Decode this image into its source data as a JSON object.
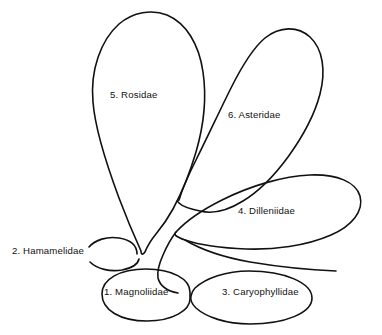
{
  "diagram": {
    "type": "bubble-relationship-diagram",
    "background_color": "#ffffff",
    "stroke_color": "#111111",
    "width": 382,
    "height": 335,
    "lobes": [
      {
        "id": "magnoliidae",
        "number": "1.",
        "name": "Magnoliidae",
        "label": "1. Magnoliidae",
        "label_x": 104,
        "label_y": 287
      },
      {
        "id": "hamamelidae",
        "number": "2.",
        "name": "Hamamelidae",
        "label": "2. Hamamelidae",
        "label_x": 12,
        "label_y": 246
      },
      {
        "id": "caryophyllidae",
        "number": "3.",
        "name": "Caryophyllidae",
        "label": "3. Caryophyllidae",
        "label_x": 222,
        "label_y": 287
      },
      {
        "id": "dilleniidae",
        "number": "4.",
        "name": "Dilleniidae",
        "label": "4. Dilleniidae",
        "label_x": 238,
        "label_y": 206
      },
      {
        "id": "rosidae",
        "number": "5.",
        "name": "Rosidae",
        "label": "5. Rosidae",
        "label_x": 110,
        "label_y": 90
      },
      {
        "id": "asteridae",
        "number": "6.",
        "name": "Asteridae",
        "label": "6. Asteridae",
        "label_x": 228,
        "label_y": 110
      }
    ]
  }
}
